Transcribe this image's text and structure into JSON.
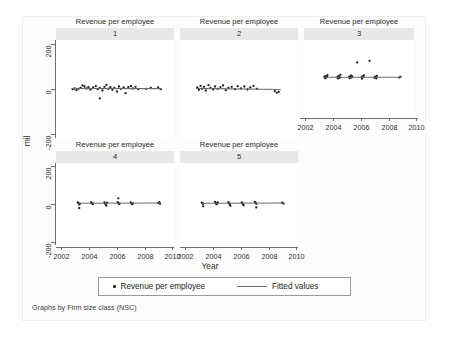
{
  "figure": {
    "ylabel": "mil",
    "xlabel": "Year",
    "caption": "Graphs by Firm size class (NSC)"
  },
  "legend": {
    "scatter_label": "Revenue per employee",
    "fit_label": "Fitted values",
    "scatter_marker": "dot-marker",
    "fit_marker": "line-marker"
  },
  "chart_data": {
    "type": "scatter",
    "title": "Revenue per employee",
    "subtitle": "",
    "xlabel": "Year",
    "ylabel": "mil",
    "xlim": [
      2001.3,
      2010.2
    ],
    "ylim": [
      -300,
      290
    ],
    "xticks": [
      2002,
      2004,
      2006,
      2008,
      2010
    ],
    "xticklabels": [
      "2002",
      "2004",
      "2006",
      "2008",
      "2010"
    ],
    "yticks": [
      200,
      0,
      -200
    ],
    "yticklabels": [
      "200",
      "0",
      "-200"
    ],
    "grid": false,
    "legend_position": "bottom",
    "by_variable": "Firm size class (NSC)",
    "panel_layout": [
      3,
      2
    ],
    "panels": [
      {
        "id": "1",
        "title": "Revenue per employee",
        "subtitle": "1",
        "row": 0,
        "col": 0,
        "xaxis_visible": false,
        "yaxis_visible": true,
        "series": [
          {
            "name": "Revenue per employee",
            "type": "scatter",
            "points": [
              [
                2002.55,
                -6
              ],
              [
                2002.7,
                -2
              ],
              [
                2002.85,
                -12
              ],
              [
                2003.0,
                -4
              ],
              [
                2003.15,
                2
              ],
              [
                2003.3,
                16
              ],
              [
                2003.45,
                10
              ],
              [
                2003.6,
                -2
              ],
              [
                2003.75,
                6
              ],
              [
                2003.9,
                -8
              ],
              [
                2004.1,
                4
              ],
              [
                2004.3,
                12
              ],
              [
                2004.45,
                -6
              ],
              [
                2004.6,
                2
              ],
              [
                2004.8,
                -14
              ],
              [
                2004.95,
                8
              ],
              [
                2005.1,
                20
              ],
              [
                2005.25,
                -4
              ],
              [
                2005.4,
                6
              ],
              [
                2005.55,
                -10
              ],
              [
                2005.7,
                2
              ],
              [
                2005.9,
                -20
              ],
              [
                2006.05,
                10
              ],
              [
                2006.2,
                -4
              ],
              [
                2006.4,
                4
              ],
              [
                2006.55,
                -30
              ],
              [
                2006.75,
                6
              ],
              [
                2006.95,
                12
              ],
              [
                2007.1,
                -2
              ],
              [
                2007.3,
                8
              ],
              [
                2007.5,
                -6
              ],
              [
                2008.1,
                -4
              ],
              [
                2008.45,
                2
              ],
              [
                2009.0,
                4
              ],
              [
                2009.2,
                -6
              ],
              [
                2004.6,
                -62
              ]
            ]
          },
          {
            "name": "Fitted values",
            "type": "line",
            "points": [
              [
                2002.5,
                -2
              ],
              [
                2009.3,
                -3
              ]
            ]
          }
        ]
      },
      {
        "id": "2",
        "title": "Revenue per employee",
        "subtitle": "2",
        "row": 0,
        "col": 1,
        "xaxis_visible": false,
        "yaxis_visible": false,
        "series": [
          {
            "name": "Revenue per employee",
            "type": "scatter",
            "points": [
              [
                2002.6,
                4
              ],
              [
                2002.72,
                -10
              ],
              [
                2002.85,
                14
              ],
              [
                2002.95,
                -4
              ],
              [
                2003.1,
                8
              ],
              [
                2003.25,
                -14
              ],
              [
                2003.45,
                18
              ],
              [
                2003.6,
                2
              ],
              [
                2003.8,
                -8
              ],
              [
                2003.95,
                10
              ],
              [
                2004.15,
                -4
              ],
              [
                2004.35,
                6
              ],
              [
                2004.55,
                16
              ],
              [
                2004.75,
                -12
              ],
              [
                2004.95,
                2
              ],
              [
                2005.2,
                8
              ],
              [
                2005.45,
                -6
              ],
              [
                2005.65,
                12
              ],
              [
                2005.9,
                -2
              ],
              [
                2006.15,
                10
              ],
              [
                2006.4,
                -8
              ],
              [
                2006.6,
                4
              ],
              [
                2006.85,
                14
              ],
              [
                2007.1,
                -4
              ],
              [
                2008.45,
                -18
              ],
              [
                2008.6,
                -28
              ],
              [
                2008.75,
                -22
              ]
            ]
          },
          {
            "name": "Fitted values",
            "type": "line",
            "points": [
              [
                2002.5,
                -1
              ],
              [
                2008.9,
                -8
              ]
            ]
          }
        ]
      },
      {
        "id": "3",
        "title": "Revenue per employee",
        "subtitle": "3",
        "row": 0,
        "col": 2,
        "xaxis_visible": true,
        "yaxis_visible": false,
        "series": [
          {
            "name": "Revenue per employee",
            "type": "scatter",
            "points": [
              [
                2002.95,
                4
              ],
              [
                2003.0,
                -6
              ],
              [
                2003.05,
                10
              ],
              [
                2003.1,
                -2
              ],
              [
                2003.15,
                6
              ],
              [
                2003.2,
                18
              ],
              [
                2004.0,
                2
              ],
              [
                2004.05,
                -8
              ],
              [
                2004.1,
                12
              ],
              [
                2004.15,
                4
              ],
              [
                2004.2,
                -4
              ],
              [
                2004.25,
                20
              ],
              [
                2004.95,
                6
              ],
              [
                2005.0,
                -6
              ],
              [
                2005.05,
                2
              ],
              [
                2005.1,
                14
              ],
              [
                2005.15,
                -2
              ],
              [
                2005.2,
                8
              ],
              [
                2005.95,
                0
              ],
              [
                2006.0,
                -10
              ],
              [
                2006.05,
                8
              ],
              [
                2006.1,
                4
              ],
              [
                2006.15,
                16
              ],
              [
                2007.0,
                -4
              ],
              [
                2007.05,
                6
              ],
              [
                2007.1,
                2
              ],
              [
                2007.15,
                -8
              ],
              [
                2007.2,
                12
              ],
              [
                2009.0,
                -2
              ],
              [
                2009.1,
                4
              ],
              [
                2005.6,
                116
              ],
              [
                2006.6,
                128
              ]
            ]
          },
          {
            "name": "Fitted values",
            "type": "line",
            "points": [
              [
                2002.9,
                1
              ],
              [
                2009.2,
                1
              ]
            ]
          }
        ]
      },
      {
        "id": "4",
        "title": "Revenue per employee",
        "subtitle": "4",
        "row": 1,
        "col": 0,
        "xaxis_visible": true,
        "yaxis_visible": true,
        "series": [
          {
            "name": "Revenue per employee",
            "type": "scatter",
            "points": [
              [
                2003.0,
                0
              ],
              [
                2003.05,
                -8
              ],
              [
                2002.95,
                6
              ],
              [
                2003.1,
                -4
              ],
              [
                2003.05,
                -34
              ],
              [
                2004.0,
                2
              ],
              [
                2004.05,
                -6
              ],
              [
                2003.95,
                8
              ],
              [
                2004.1,
                -2
              ],
              [
                2005.0,
                0
              ],
              [
                2005.05,
                -10
              ],
              [
                2004.95,
                6
              ],
              [
                2005.1,
                -16
              ],
              [
                2005.15,
                4
              ],
              [
                2006.0,
                2
              ],
              [
                2006.05,
                -6
              ],
              [
                2005.95,
                8
              ],
              [
                2006.1,
                -2
              ],
              [
                2006.0,
                36
              ],
              [
                2007.0,
                0
              ],
              [
                2007.05,
                -6
              ],
              [
                2006.95,
                6
              ],
              [
                2007.1,
                -2
              ],
              [
                2009.0,
                2
              ],
              [
                2009.1,
                8
              ],
              [
                2009.15,
                -4
              ]
            ]
          },
          {
            "name": "Fitted values",
            "type": "line",
            "points": [
              [
                2002.95,
                0
              ],
              [
                2009.2,
                2
              ]
            ]
          }
        ]
      },
      {
        "id": "5",
        "title": "Revenue per employee",
        "subtitle": "5",
        "row": 1,
        "col": 1,
        "xaxis_visible": true,
        "yaxis_visible": false,
        "series": [
          {
            "name": "Revenue per employee",
            "type": "scatter",
            "points": [
              [
                2003.0,
                0
              ],
              [
                2003.05,
                -4
              ],
              [
                2002.95,
                4
              ],
              [
                2003.05,
                -22
              ],
              [
                2004.0,
                2
              ],
              [
                2004.05,
                -8
              ],
              [
                2003.95,
                10
              ],
              [
                2004.1,
                -4
              ],
              [
                2004.15,
                6
              ],
              [
                2005.0,
                0
              ],
              [
                2005.05,
                -6
              ],
              [
                2004.95,
                8
              ],
              [
                2005.1,
                -18
              ],
              [
                2006.0,
                2
              ],
              [
                2006.05,
                -6
              ],
              [
                2005.95,
                6
              ],
              [
                2006.1,
                -14
              ],
              [
                2007.0,
                4
              ],
              [
                2007.05,
                -4
              ],
              [
                2006.95,
                10
              ],
              [
                2007.05,
                -30
              ],
              [
                2009.0,
                4
              ],
              [
                2009.1,
                -2
              ]
            ]
          },
          {
            "name": "Fitted values",
            "type": "line",
            "points": [
              [
                2002.95,
                0
              ],
              [
                2009.2,
                2
              ]
            ]
          }
        ]
      }
    ]
  }
}
